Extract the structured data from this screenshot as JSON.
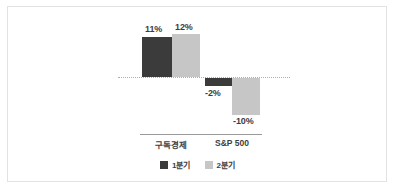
{
  "chart_data": {
    "type": "bar",
    "title": "",
    "subtitle": "",
    "xlabel": "",
    "ylabel": "",
    "categories": [
      "구독경제",
      "S&P 500"
    ],
    "series": [
      {
        "name": "1분기",
        "color": "#3b3b3b",
        "values": [
          11,
          -2
        ],
        "labels": [
          "11%",
          "-2%"
        ]
      },
      {
        "name": "2분기",
        "color": "#c6c6c6",
        "values": [
          12,
          -10
        ],
        "labels": [
          "12%",
          "-10%"
        ]
      }
    ],
    "value_unit": "%",
    "ylim": [
      -12,
      14
    ],
    "zero_line": 0,
    "grid": false,
    "legend_position": "bottom"
  },
  "legend": {
    "items": [
      {
        "label": "1분기",
        "color": "#3b3b3b"
      },
      {
        "label": "2분기",
        "color": "#c6c6c6"
      }
    ]
  },
  "colors": {
    "series_1": "#3b3b3b",
    "series_2": "#c6c6c6",
    "frame_border": "#e2e2e2",
    "axis_line": "#9a9a9a",
    "zero_line": "#b0b0b0",
    "text": "#3d3d3d",
    "background": "#ffffff"
  }
}
